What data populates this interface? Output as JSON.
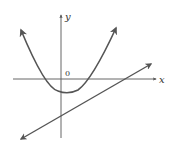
{
  "figure": {
    "axes": {
      "x_label": "x",
      "y_label": "y",
      "origin_label": "0"
    },
    "curves": [
      {
        "name": "parabola",
        "type": "upward parabola",
        "vertex_below_x_axis": true,
        "arrows": "both ends up"
      },
      {
        "name": "line",
        "type": "straight line",
        "slope": "positive",
        "arrows": "both ends"
      }
    ],
    "colors": {
      "axis": "#555555",
      "curve": "#555555"
    }
  }
}
